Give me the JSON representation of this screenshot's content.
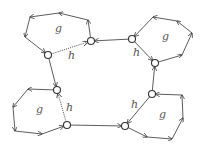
{
  "diagram": {
    "width": 204,
    "height": 150,
    "colors": {
      "stroke": "#333333",
      "node_fill": "#ffffff",
      "label": "#555555"
    },
    "nodes": [
      {
        "id": "A",
        "x": 48,
        "y": 55
      },
      {
        "id": "B",
        "x": 91,
        "y": 41
      },
      {
        "id": "C",
        "x": 132,
        "y": 39
      },
      {
        "id": "D",
        "x": 155,
        "y": 63
      },
      {
        "id": "E",
        "x": 152,
        "y": 94
      },
      {
        "id": "F",
        "x": 125,
        "y": 126
      },
      {
        "id": "G",
        "x": 67,
        "y": 125
      },
      {
        "id": "H",
        "x": 57,
        "y": 90
      }
    ],
    "cycles": [
      {
        "name": "top-left",
        "label": "g",
        "label_pos": [
          55,
          32
        ],
        "path": [
          [
            91,
            41
          ],
          [
            88,
            20
          ],
          [
            59,
            13
          ],
          [
            30,
            17
          ],
          [
            25,
            37
          ],
          [
            48,
            55
          ]
        ]
      },
      {
        "name": "top-right",
        "label": "g",
        "label_pos": [
          162,
          40
        ],
        "path": [
          [
            155,
            63
          ],
          [
            182,
            55
          ],
          [
            192,
            33
          ],
          [
            177,
            21
          ],
          [
            153,
            17
          ],
          [
            132,
            39
          ]
        ]
      },
      {
        "name": "bottom-left",
        "label": "g",
        "label_pos": [
          36,
          113
        ],
        "path": [
          [
            57,
            90
          ],
          [
            28,
            89
          ],
          [
            13,
            107
          ],
          [
            15,
            131
          ],
          [
            42,
            134
          ],
          [
            67,
            125
          ]
        ]
      },
      {
        "name": "bottom-right",
        "label": "g",
        "label_pos": [
          159,
          118
        ],
        "path": [
          [
            125,
            126
          ],
          [
            147,
            137
          ],
          [
            172,
            139
          ],
          [
            183,
            118
          ],
          [
            182,
            95
          ],
          [
            152,
            94
          ]
        ]
      }
    ],
    "links": [
      {
        "from": [
          48,
          55
        ],
        "to": [
          91,
          41
        ],
        "style": "dotted",
        "label": "h",
        "label_pos": [
          68,
          59
        ]
      },
      {
        "from": [
          132,
          39
        ],
        "to": [
          91,
          41
        ],
        "style": "solid"
      },
      {
        "from": [
          132,
          39
        ],
        "to": [
          155,
          63
        ],
        "style": "solid",
        "label": "h",
        "label_pos": [
          133,
          56
        ]
      },
      {
        "from": [
          152,
          94
        ],
        "to": [
          155,
          63
        ],
        "style": "solid"
      },
      {
        "from": [
          152,
          94
        ],
        "to": [
          125,
          126
        ],
        "style": "solid",
        "label": "h",
        "label_pos": [
          131,
          108
        ]
      },
      {
        "from": [
          67,
          125
        ],
        "to": [
          125,
          126
        ],
        "style": "solid"
      },
      {
        "from": [
          67,
          125
        ],
        "to": [
          57,
          90
        ],
        "style": "dotted",
        "label": "h",
        "label_pos": [
          66,
          111
        ]
      },
      {
        "from": [
          48,
          55
        ],
        "to": [
          57,
          90
        ],
        "style": "solid"
      }
    ]
  }
}
